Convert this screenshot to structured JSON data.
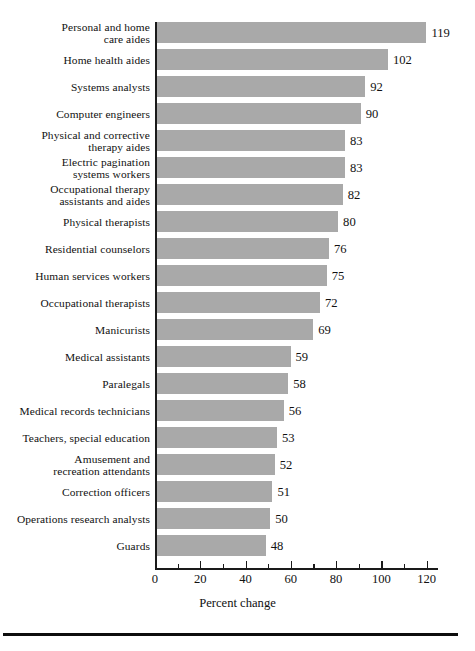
{
  "chart_data": {
    "type": "bar",
    "orientation": "horizontal",
    "title": "",
    "xlabel": "Percent change",
    "ylabel": "",
    "xlim": [
      0,
      125
    ],
    "xticks": [
      0,
      20,
      40,
      60,
      80,
      100,
      120
    ],
    "xtick_labels": [
      "0",
      "20",
      "40",
      "60",
      "80",
      "100",
      "120"
    ],
    "minor_tick_step": 10,
    "grid": false,
    "legend": null,
    "bar_color": "#a9a9a9",
    "axis_color": "#1a1a1a",
    "value_labels_shown": true,
    "categories": [
      "Personal and home\ncare aides",
      "Home health aides",
      "Systems analysts",
      "Computer engineers",
      "Physical and corrective\ntherapy aides",
      "Electric pagination\nsystems workers",
      "Occupational therapy\nassistants and aides",
      "Physical therapists",
      "Residential counselors",
      "Human services workers",
      "Occupational therapists",
      "Manicurists",
      "Medical assistants",
      "Paralegals",
      "Medical records technicians",
      "Teachers, special education",
      "Amusement and\nrecreation attendants",
      "Correction officers",
      "Operations research analysts",
      "Guards"
    ],
    "values": [
      119,
      102,
      92,
      90,
      83,
      83,
      82,
      80,
      76,
      75,
      72,
      69,
      59,
      58,
      56,
      53,
      52,
      51,
      50,
      48
    ],
    "value_label_strings": [
      "119",
      "102",
      "92",
      "90",
      "83",
      "83",
      "82",
      "80",
      "76",
      "75",
      "72",
      "69",
      "59",
      "58",
      "56",
      "53",
      "52",
      "51",
      "50",
      "48"
    ]
  }
}
